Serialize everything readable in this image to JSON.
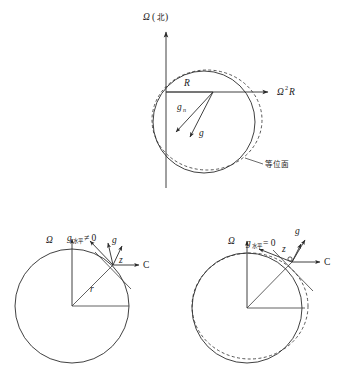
{
  "figure": {
    "title": "",
    "background_color": "#ffffff",
    "line_color": "#2b2b2b",
    "dash_color": "#3a3a3a"
  },
  "panels": {
    "top": {
      "name": "equipotential-surface-overview",
      "axis_vertical_label": "Ω",
      "axis_vertical_paren_open": "(",
      "axis_vertical_cjk": "北",
      "axis_vertical_paren_close": ")",
      "axis_horizontal_label": "Ω",
      "axis_horizontal_sup": "2",
      "axis_horizontal_tail": "R",
      "radius_label": "R",
      "gravity_newton_label": "g",
      "gravity_newton_sub": "n",
      "gravity_label": "g",
      "equipotential_label": "等位面"
    },
    "bottom_left": {
      "name": "spherical-earth-case",
      "omega_label": "Ω",
      "g_horizontal_label": "g",
      "g_horizontal_sub": "水平",
      "g_horizontal_relation": "≠ 0",
      "gravity_label": "g",
      "z_axis_label": "z",
      "c_axis_label": "C",
      "radius_label": "r"
    },
    "bottom_right": {
      "name": "oblate-earth-case",
      "omega_label": "Ω",
      "g_horizontal_label": "g",
      "g_horizontal_sub": "水平",
      "g_horizontal_relation": "= 0",
      "gravity_label": "g",
      "z_axis_label": "z",
      "c_axis_label": "C"
    }
  }
}
